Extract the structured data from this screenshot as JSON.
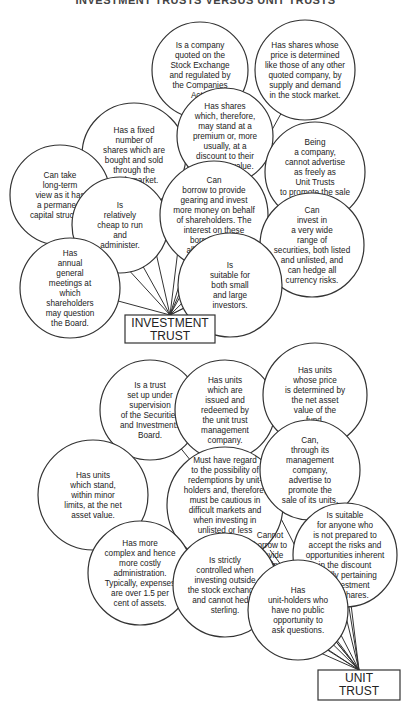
{
  "title": "INVESTMENT TRUSTS VERSUS UNIT TRUSTS",
  "investment_trust": {
    "hub_label": [
      "INVESTMENT",
      "TRUST"
    ],
    "hub": {
      "x": 125,
      "y": 315,
      "w": 90,
      "h": 28
    },
    "bubbles": [
      {
        "cx": 200,
        "cy": 70,
        "r": 48,
        "lines": [
          "Is a company",
          "quoted on the",
          "Stock Exchange",
          "and regulated by",
          "the Companies",
          "Acts."
        ]
      },
      {
        "cx": 305,
        "cy": 70,
        "r": 50,
        "lines": [
          "Has shares whose",
          "price is determined",
          "like those of any other",
          "quoted company, by",
          "supply and demand",
          "in the stock market."
        ]
      },
      {
        "cx": 134,
        "cy": 155,
        "r": 52,
        "lines": [
          "Has a fixed",
          "number of",
          "shares which are",
          "bought and sold",
          "through the",
          "stock market."
        ]
      },
      {
        "cx": 225,
        "cy": 136,
        "r": 48,
        "lines": [
          "Has shares",
          "which, therefore,",
          "may stand at a",
          "premium or, more",
          "usually, at a",
          "discount to their",
          "net asset value."
        ]
      },
      {
        "cx": 315,
        "cy": 172,
        "r": 50,
        "lines": [
          "Being",
          "a company,",
          "cannot advertise",
          "as freely as",
          "Unit Trusts",
          "to promote the sale",
          "of its shares."
        ]
      },
      {
        "cx": 60,
        "cy": 195,
        "r": 50,
        "lines": [
          "Can take",
          "long-term",
          "view as it has",
          "a permanent",
          "capital structure."
        ]
      },
      {
        "cx": 120,
        "cy": 225,
        "r": 48,
        "lines": [
          "Is",
          "relatively",
          "cheap to run",
          "and",
          "administer."
        ]
      },
      {
        "cx": 214,
        "cy": 215,
        "r": 54,
        "lines": [
          "Can",
          "borrow to provide",
          "gearing and invest",
          "more money on behalf",
          "of shareholders. The",
          "interest on these",
          "borrowings is",
          "allowed for tax."
        ]
      },
      {
        "cx": 312,
        "cy": 245,
        "r": 52,
        "lines": [
          "Can",
          "invest in",
          "a very wide",
          "range of",
          "securities, both listed",
          "and unlisted, and",
          "can hedge all",
          "currency risks."
        ]
      },
      {
        "cx": 70,
        "cy": 288,
        "r": 50,
        "lines": [
          "Has",
          "annual",
          "general",
          "meetings at",
          "which",
          "shareholders",
          "may question",
          "the Board."
        ]
      },
      {
        "cx": 230,
        "cy": 285,
        "r": 52,
        "lines": [
          "Is",
          "suitable for",
          "both small",
          "and large",
          "investors."
        ]
      }
    ]
  },
  "unit_trust": {
    "hub_label": [
      "UNIT",
      "TRUST"
    ],
    "hub": {
      "x": 318,
      "y": 670,
      "w": 82,
      "h": 30
    },
    "bubbles": [
      {
        "cx": 150,
        "cy": 410,
        "r": 50,
        "lines": [
          "Is a trust",
          "set up under",
          "supervision",
          "of the Securities",
          "and Investments",
          "Board."
        ]
      },
      {
        "cx": 225,
        "cy": 410,
        "r": 50,
        "lines": [
          "Has units",
          "which are",
          "issued and",
          "redeemed by",
          "the unit trust",
          "management",
          "company."
        ]
      },
      {
        "cx": 315,
        "cy": 395,
        "r": 52,
        "lines": [
          "Has units",
          "whose price",
          "is determined by",
          "the net asset",
          "value of the",
          "fund."
        ]
      },
      {
        "cx": 93,
        "cy": 495,
        "r": 55,
        "lines": [
          "Has units",
          "which stand,",
          "within minor",
          "limits, at the net",
          "asset value."
        ]
      },
      {
        "cx": 225,
        "cy": 505,
        "r": 58,
        "lines": [
          "Must have regard",
          "to the possibility of",
          "redemptions by unit-",
          "holders and, therefore,",
          "must be cautious in",
          "difficult markets and",
          "when investing in",
          "unlisted or less",
          "marketable",
          "investments."
        ]
      },
      {
        "cx": 310,
        "cy": 470,
        "r": 50,
        "lines": [
          "Can,",
          "through its",
          "management",
          "company,",
          "advertise to",
          "promote the",
          "sale of its units."
        ]
      },
      {
        "cx": 270,
        "cy": 550,
        "r": 30,
        "lines": [
          "Cannot",
          "borrow to",
          "provide",
          "gearing."
        ],
        "no_circle": true
      },
      {
        "cx": 140,
        "cy": 573,
        "r": 52,
        "lines": [
          "Has more",
          "complex and hence",
          "more costly",
          "administration.",
          "Typically, expenses",
          "are over 1.5    per",
          "cent of assets."
        ]
      },
      {
        "cx": 225,
        "cy": 585,
        "r": 52,
        "lines": [
          "Is strictly",
          "controlled when",
          "investing outside",
          "the stock exchanges",
          "and cannot hedge",
          "sterling."
        ]
      },
      {
        "cx": 345,
        "cy": 555,
        "r": 52,
        "lines": [
          "Is suitable",
          "for anyone who",
          "is not prepared to",
          "accept the risks and",
          "opportunities inherent",
          "in the discount",
          "usually pertaining",
          "to Investment",
          "Trust shares."
        ]
      },
      {
        "cx": 298,
        "cy": 610,
        "r": 50,
        "lines": [
          "Has",
          "unit-holders who",
          "have no public",
          "opportunity to",
          "ask questions."
        ]
      }
    ]
  }
}
